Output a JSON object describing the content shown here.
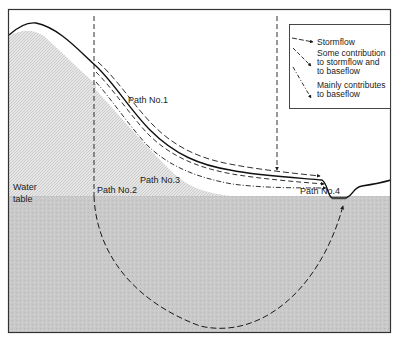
{
  "diagram": {
    "type": "hillslope-flow-paths",
    "labels": {
      "path1": "Path No.1",
      "path2": "Path No.2",
      "path3": "Path No.3",
      "path4": "Path No.4",
      "water_table_line1": "Water",
      "water_table_line2": "table"
    },
    "legend": {
      "items": [
        {
          "symbol": "long-dash-arrow",
          "lines": [
            "Stormflow"
          ]
        },
        {
          "symbol": "medium-dash-arrow",
          "lines": [
            "Some contribution",
            "to stormflow and",
            "to baseflow"
          ]
        },
        {
          "symbol": "dash-dot-arrow",
          "lines": [
            "Mainly contributes",
            "to baseflow"
          ]
        }
      ]
    },
    "colors": {
      "frame": "#333333",
      "groundwater_fill": "#c8c8c8",
      "unsaturated_hatch": "#dcdcdc",
      "line": "#1a1a1a",
      "background": "#ffffff"
    }
  }
}
